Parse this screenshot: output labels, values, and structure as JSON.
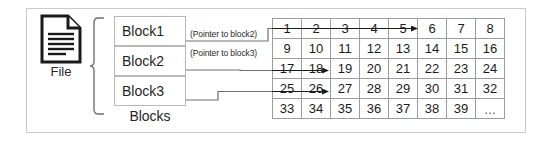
{
  "diagram": {
    "title_present": false,
    "file": {
      "icon": "document-file-icon",
      "label": "File"
    },
    "blocks": {
      "group_label": "Blocks",
      "items": [
        {
          "label": "Block1"
        },
        {
          "label": "Block2"
        },
        {
          "label": "Block3"
        }
      ]
    },
    "pointers": [
      {
        "caption": "(Pointer to block2)",
        "from": "Block1",
        "target_cell": "6"
      },
      {
        "caption": "(Pointer to block3)",
        "from": "Block2",
        "target_cell": "19"
      },
      {
        "caption": "",
        "from": "Block3",
        "target_cell": "27"
      }
    ],
    "grid": {
      "columns": 8,
      "rows": 5,
      "cells": [
        [
          "1",
          "2",
          "3",
          "4",
          "5",
          "6",
          "7",
          "8"
        ],
        [
          "9",
          "10",
          "11",
          "12",
          "13",
          "14",
          "15",
          "16"
        ],
        [
          "17",
          "18",
          "19",
          "20",
          "21",
          "22",
          "23",
          "24"
        ],
        [
          "25",
          "26",
          "27",
          "28",
          "29",
          "30",
          "31",
          "32"
        ],
        [
          "33",
          "34",
          "35",
          "36",
          "37",
          "38",
          "39",
          "…"
        ]
      ]
    },
    "colors": {
      "outer_border": "#c9cbcd",
      "grid_line": "#9a9c9e",
      "block_border": "#b6b8ba",
      "connector": "#6f7072",
      "text": "#1f1f1f",
      "icon": "#1a1a1a"
    }
  }
}
